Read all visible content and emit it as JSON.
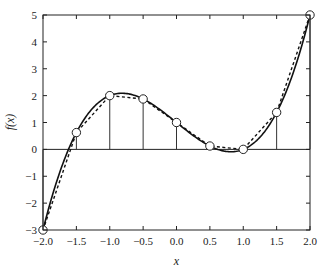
{
  "chart_data": {
    "type": "line",
    "title": "",
    "xlabel": "x",
    "ylabel": "f(x)",
    "xlim": [
      -2.0,
      2.0
    ],
    "ylim": [
      -3,
      5
    ],
    "xticks": [
      "-2.0",
      "-1.5",
      "-1.0",
      "-0.5",
      "0.0",
      "0.5",
      "1.0",
      "1.5",
      "2.0"
    ],
    "yticks": [
      "-3",
      "-2",
      "-1",
      "0",
      "1",
      "2",
      "3",
      "4",
      "5"
    ],
    "grid": false,
    "legend": null,
    "series": [
      {
        "name": "f(x) = x^3 - 2x + 1",
        "style": "solid",
        "function": "x^3 - 2x + 1"
      },
      {
        "name": "interpolation",
        "style": "dashed",
        "x": [
          -2.0,
          -1.5,
          -1.0,
          -0.5,
          0.0,
          0.5,
          1.0,
          1.5,
          2.0
        ],
        "y": [
          -3,
          0.625,
          2,
          1.875,
          1,
          0.125,
          0,
          1.375,
          5
        ]
      },
      {
        "name": "sample points",
        "style": "markers-with-stems",
        "marker": "open-circle",
        "x": [
          -2.0,
          -1.5,
          -1.0,
          -0.5,
          0.0,
          0.5,
          1.0,
          1.5,
          2.0
        ],
        "y": [
          -3,
          0.625,
          2,
          1.875,
          1,
          0.125,
          0,
          1.375,
          5
        ]
      }
    ]
  }
}
